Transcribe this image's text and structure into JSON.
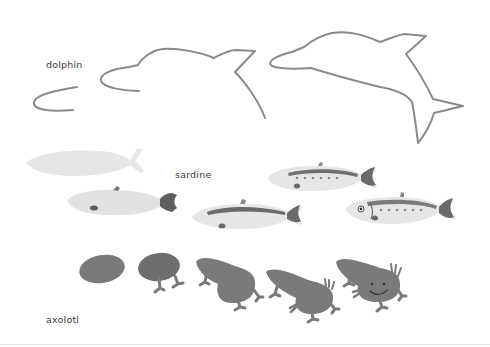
{
  "rows": [
    {
      "label": "dolphin",
      "stages": 4,
      "style": "outline drawing progression"
    },
    {
      "label": "sardine",
      "stages": 5,
      "style": "watercolor fish progression"
    },
    {
      "label": "axolotl",
      "stages": 5,
      "style": "watercolor axolotl progression"
    }
  ],
  "colors": {
    "background": "#ffffff",
    "stroke": "#8a8a8a",
    "sardine_body": "#e4e4e4",
    "sardine_back": "#7f7f7f",
    "sardine_fin": "#6a6a6a",
    "axolotl_body": "#7a7a7a",
    "label_text": "#3a3a3a"
  }
}
